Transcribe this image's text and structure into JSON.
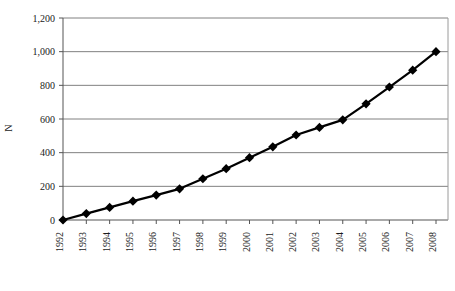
{
  "chart_data": {
    "type": "line",
    "title": "",
    "subtitle": "",
    "xlabel": "",
    "ylabel": "N",
    "categories": [
      "1992",
      "1993",
      "1994",
      "1995",
      "1996",
      "1997",
      "1998",
      "1999",
      "2000",
      "2001",
      "2002",
      "2003",
      "2004",
      "2005",
      "2006",
      "2007",
      "2008"
    ],
    "values": [
      0,
      38,
      75,
      112,
      148,
      185,
      245,
      305,
      370,
      435,
      505,
      550,
      595,
      690,
      790,
      890,
      1000
    ],
    "series": [
      {
        "name": "N",
        "values": [
          0,
          38,
          75,
          112,
          148,
          185,
          245,
          305,
          370,
          435,
          505,
          550,
          595,
          690,
          790,
          890,
          1000
        ]
      }
    ],
    "ylim": [
      0,
      1200
    ],
    "ytick_values": [
      0,
      200,
      400,
      600,
      800,
      1000,
      1200
    ],
    "ytick_labels": [
      "0",
      "200",
      "400",
      "600",
      "800",
      "1,000",
      "1,200"
    ],
    "grid": true,
    "grid_axis": "y",
    "legend": false,
    "legend_position": "none",
    "marker": "diamond",
    "line_color": "#000000",
    "marker_color": "#000000",
    "grid_color": "#808080",
    "axis_color": "#555555",
    "plot_background": "#ffffff",
    "xtick_rotation": 90
  },
  "geometry": {
    "plot_left": 63,
    "plot_right": 448,
    "plot_top": 18,
    "plot_bottom": 220
  }
}
